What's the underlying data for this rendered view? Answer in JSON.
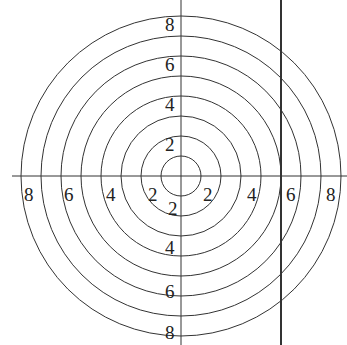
{
  "diagram": {
    "type": "concentric-circle-target",
    "center": [
      181,
      176
    ],
    "ring_radii": [
      20,
      40,
      60,
      80,
      100,
      120,
      140,
      160
    ],
    "stroke_color": "#333333",
    "vertical_line_x": 281,
    "labels": {
      "top": [
        "8",
        "6",
        "4",
        "2"
      ],
      "bottom": [
        "2",
        "4",
        "6",
        "8"
      ],
      "left": [
        "8",
        "6",
        "4",
        "2"
      ],
      "right": [
        "2",
        "4",
        "6",
        "8"
      ]
    }
  }
}
